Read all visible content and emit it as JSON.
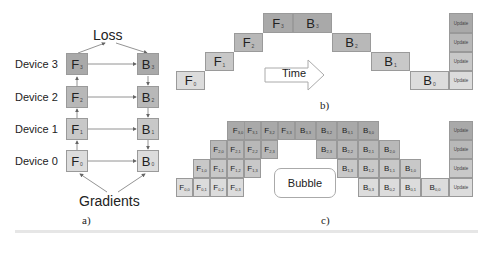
{
  "panel_a": {
    "caption": "a)",
    "top_label": "Loss",
    "bottom_label": "Gradients",
    "devices": [
      {
        "label": "Device 3",
        "forward": "F",
        "forward_sub": "3",
        "backward": "B",
        "backward_sub": "3"
      },
      {
        "label": "Device 2",
        "forward": "F",
        "forward_sub": "2",
        "backward": "B",
        "backward_sub": "2"
      },
      {
        "label": "Device 1",
        "forward": "F",
        "forward_sub": "1",
        "backward": "B",
        "backward_sub": "1"
      },
      {
        "label": "Device 0",
        "forward": "F",
        "forward_sub": "0",
        "backward": "B",
        "backward_sub": "0"
      }
    ]
  },
  "panel_b": {
    "caption": "b)",
    "time_label": "Time",
    "forward": [
      {
        "label": "F",
        "sub": "0"
      },
      {
        "label": "F",
        "sub": "1"
      },
      {
        "label": "F",
        "sub": "2"
      },
      {
        "label": "F",
        "sub": "3"
      }
    ],
    "backward": [
      {
        "label": "B",
        "sub": "3"
      },
      {
        "label": "B",
        "sub": "2"
      },
      {
        "label": "B",
        "sub": "1"
      },
      {
        "label": "B",
        "sub": "0"
      }
    ],
    "updates": [
      "Update",
      "Update",
      "Update",
      "Update"
    ]
  },
  "panel_c": {
    "caption": "c)",
    "bubble_label": "Bubble",
    "rows": [
      {
        "device": 3,
        "forward": [
          [
            "F",
            "3,0"
          ],
          [
            "F",
            "3,1"
          ],
          [
            "F",
            "3,2"
          ],
          [
            "F",
            "3,3"
          ]
        ],
        "backward": [
          [
            "B",
            "3,3"
          ],
          [
            "B",
            "3,2"
          ],
          [
            "B",
            "3,1"
          ],
          [
            "B",
            "3,0"
          ]
        ]
      },
      {
        "device": 2,
        "forward": [
          [
            "F",
            "2,0"
          ],
          [
            "F",
            "2,1"
          ],
          [
            "F",
            "2,2"
          ],
          [
            "F",
            "2,3"
          ]
        ],
        "backward": [
          [
            "B",
            "2,3"
          ],
          [
            "B",
            "2,2"
          ],
          [
            "B",
            "2,1"
          ],
          [
            "B",
            "2,0"
          ]
        ]
      },
      {
        "device": 1,
        "forward": [
          [
            "F",
            "1,0"
          ],
          [
            "F",
            "1,1"
          ],
          [
            "F",
            "1,2"
          ],
          [
            "F",
            "1,3"
          ]
        ],
        "backward": [
          [
            "B",
            "1,3"
          ],
          [
            "B",
            "1,2"
          ],
          [
            "B",
            "1,1"
          ],
          [
            "B",
            "1,0"
          ]
        ]
      },
      {
        "device": 0,
        "forward": [
          [
            "F",
            "0,0"
          ],
          [
            "F",
            "0,1"
          ],
          [
            "F",
            "0,2"
          ],
          [
            "F",
            "0,3"
          ]
        ],
        "backward": [
          [
            "B",
            "0,3"
          ],
          [
            "B",
            "0,2"
          ],
          [
            "B",
            "0,1"
          ],
          [
            "B",
            "0,0"
          ]
        ]
      }
    ],
    "updates": [
      "Update",
      "Update",
      "Update",
      "Update"
    ]
  }
}
